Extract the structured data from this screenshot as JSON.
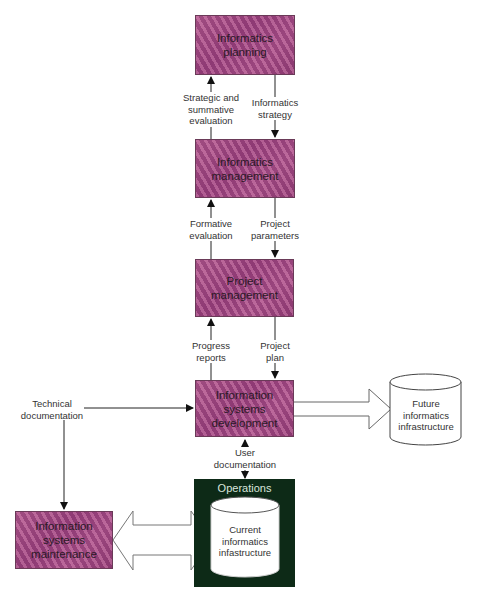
{
  "diagram": {
    "boxes": {
      "informatics_planning": [
        "Informatics",
        "planning"
      ],
      "informatics_management": [
        "Informatics",
        "management"
      ],
      "project_management": [
        "Project",
        "management"
      ],
      "isd": [
        "Information",
        "systems",
        "development"
      ],
      "maintenance": [
        "Information",
        "systems",
        "maintenance"
      ]
    },
    "flows": {
      "strategic_eval": [
        "Strategic and",
        "summative",
        "evaluation"
      ],
      "informatics_strategy": [
        "Informatics",
        "strategy"
      ],
      "formative_eval": [
        "Formative",
        "evaluation"
      ],
      "project_parameters": [
        "Project",
        "parameters"
      ],
      "progress_reports": [
        "Progress",
        "reports"
      ],
      "project_plan": [
        "Project",
        "plan"
      ],
      "technical_doc": [
        "Technical",
        "documentation"
      ],
      "user_doc": [
        "User",
        "documentation"
      ]
    },
    "operations": {
      "title": "Operations",
      "current": [
        "Current",
        "informatics",
        "infastructure"
      ]
    },
    "future": [
      "Future",
      "informatics",
      "infrastructure"
    ],
    "colors": {
      "box_fill": "#9a4a80",
      "operations_fill": "#0d2a17",
      "line": "#222222"
    }
  }
}
